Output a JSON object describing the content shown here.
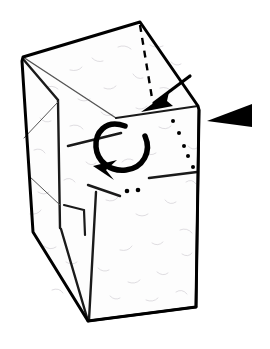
{
  "figure": {
    "caption": "",
    "background_color": "#ffffff",
    "ink_color": "#000000",
    "paper_color": "#fdfdfd",
    "texture_color": "#c9c5cc",
    "width": 270,
    "height": 349
  },
  "model": {
    "name": "tall-box-form",
    "description": "Tall quadrilateral prism of folded paper, viewed at three-quarter angle with an open top forming a peaked roof.",
    "apex_label": "",
    "outline_path": "M 140 22 L 23 57 L 22 61 L 33 232 L 88 321 L 196 307 L 199 110 L 198 106 Z"
  },
  "faces": [
    {
      "name": "top-left-roof-panel",
      "path": "M 140 22 L 23 57 L 116 118 Z"
    },
    {
      "name": "top-right-roof-panel",
      "path": "M 140 22 L 198 106 L 116 118 Z"
    },
    {
      "name": "left-side-panel",
      "path": "M 23 57 L 22 61 L 33 232 L 60 228 L 58 100 Z"
    },
    {
      "name": "front-panel",
      "path": "M 58 100 L 60 228 L 88 321 L 196 307 L 199 110 L 116 118 Z"
    },
    {
      "name": "inner-flap-panel",
      "path": "M 60 228 L 88 321 L 84 231 Z"
    }
  ],
  "creases": [
    {
      "name": "roof-ridge-left",
      "path": "M 23 57 L 116 118",
      "weight": 1.4
    },
    {
      "name": "roof-ridge-right",
      "path": "M 198 106 L 116 118",
      "weight": 2.0
    },
    {
      "name": "left-vertical-edge",
      "path": "M 23 59 L 58 100 L 60 228",
      "weight": 2.4
    },
    {
      "name": "left-panel-diagonal-upper",
      "path": "M 58 102 L 24 138",
      "weight": 1.0
    },
    {
      "name": "left-panel-diagonal-lower",
      "path": "M 29 176 L 60 205",
      "weight": 1.0
    },
    {
      "name": "front-horizontal-upper",
      "path": "M 68 146 L 121 133",
      "weight": 2.6
    },
    {
      "name": "front-horizontal-lower",
      "path": "M 88 185 L 120 196",
      "weight": 2.4
    },
    {
      "name": "front-right-horizontal",
      "path": "M 149 178 L 197 172",
      "weight": 2.6
    },
    {
      "name": "inner-flap-fold",
      "path": "M 64 205 L 84 210 L 85 235",
      "weight": 2.2
    },
    {
      "name": "inner-flap-spine",
      "path": "M 61 229 L 88 321",
      "weight": 2.4
    },
    {
      "name": "front-lower-diagonal",
      "path": "M 96 192 L 89 320",
      "weight": 2.4
    },
    {
      "name": "bottom-edge",
      "path": "M 88 321 L 196 307",
      "weight": 2.6
    },
    {
      "name": "right-vertical-edge",
      "path": "M 199 110 L 196 307",
      "weight": 2.6
    }
  ],
  "dashed_guide": {
    "name": "valley-fold-guide",
    "path": "M 140 25 L 152 98",
    "dash_pattern": "7 6",
    "weight": 2.4
  },
  "dot_lines": [
    {
      "name": "hidden-edge-dots-diagonal",
      "dots": [
        {
          "cx": 173,
          "cy": 121,
          "r": 2.0
        },
        {
          "cx": 179,
          "cy": 133,
          "r": 2.0
        },
        {
          "cx": 184,
          "cy": 146,
          "r": 2.0
        },
        {
          "cx": 188,
          "cy": 156,
          "r": 2.0
        },
        {
          "cx": 193,
          "cy": 167,
          "r": 2.0
        }
      ]
    },
    {
      "name": "hidden-edge-dots-horizontal",
      "dots": [
        {
          "cx": 127,
          "cy": 191,
          "r": 2.3
        },
        {
          "cx": 138,
          "cy": 190,
          "r": 2.3
        }
      ]
    }
  ],
  "arrows": [
    {
      "name": "fold-down-arrow",
      "type": "straight-with-arrowhead",
      "direction": "down-left",
      "shaft_path": "M 190 76 L 154 103",
      "head_path": "M 141 112 L 169 92 L 167 101 L 173 106 Z",
      "weight": 3.2
    },
    {
      "name": "rotation-loop-arrow",
      "type": "curved-loop",
      "direction": "counter-clockwise",
      "loop_path": "M 125 126 C 105 119, 95 133, 96 147 C 97 161, 110 172, 126 170 C 143 168, 152 152, 145 136",
      "head_path": "M 93 166 L 117 160 L 106 170 L 114 180 Z",
      "weight": 5.5
    },
    {
      "name": "view-direction-arrow",
      "type": "solid-triangle",
      "direction": "left",
      "path": "M 207 121 L 252 104 L 252 127 Z"
    }
  ],
  "texture": {
    "name": "paper-fiber-texture",
    "strokes": [
      "M 46 88 q 6 -4 12 1",
      "M 70 70 q 8 2 12 -3",
      "M 92 58 q 5 5 11 3",
      "M 118 47 q 7 -3 13 2",
      "M 150 45 q 6 4 13 1",
      "M 171 62 q 5 5 10 2",
      "M 160 88 q 8 -2 12 4",
      "M 133 74 q 4 6 10 4",
      "M 104 88 q 7 3 12 -2",
      "M 78 99 q 6 4 12 0",
      "M 40 118 q 5 6 11 3",
      "M 34 150 q 7 -3 11 3",
      "M 38 192 q 6 4 11 0",
      "M 30 214 q 8 1 11 -4",
      "M 44 246 q 6 5 12 1",
      "M 70 126 q 8 -3 13 3",
      "M 101 112 q 5 6 12 2",
      "M 136 108 q 6 3 11 -2",
      "M 159 127 q 7 4 12 -1",
      "M 144 152 q 6 5 12 1",
      "M 122 162 q 5 -5 11 -2",
      "M 106 200 q 8 3 12 -3",
      "M 136 214 q 6 4 12 0",
      "M 165 200 q 5 6 11 2",
      "M 180 230 q 7 -3 12 3",
      "M 152 243 q 6 4 11 -1",
      "M 120 250 q 8 2 12 -4",
      "M 98 268 q 5 5 11 2",
      "M 128 282 q 7 3 12 -2",
      "M 157 272 q 6 5 11 1",
      "M 176 292 q 6 -4 11 2",
      "M 146 300 q 7 3 12 -2",
      "M 110 296 q 5 5 10 2",
      "M 66 262 q 6 4 11 0",
      "M 52 290 q 7 -3 11 3",
      "M 188 146 q 5 5 9 2",
      "M 186 182 q 6 -4 10 2",
      "M 182 254 q 6 4 10 -1",
      "M 86 162 q 5 5 10 1",
      "M 64 180 q 6 -4 11 2"
    ]
  }
}
